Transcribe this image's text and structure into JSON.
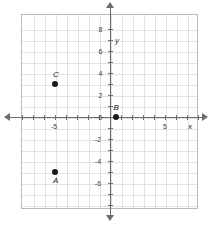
{
  "figure": {
    "axis_labels": {
      "x": "x",
      "y": "y"
    },
    "colors": {
      "grid": "#e2e2e6",
      "axis": "#6b6b70",
      "point": "#1a1a1a",
      "frame": "#b9b9bd",
      "background": "#ffffff"
    }
  },
  "chart_data": {
    "type": "scatter",
    "title": "",
    "xlabel": "x",
    "ylabel": "y",
    "xlim": [
      -8,
      8
    ],
    "ylim": [
      -8,
      8
    ],
    "grid": true,
    "grid_step": 1,
    "legend": "none",
    "xticks": [
      -8,
      -7,
      -6,
      -5,
      -4,
      -3,
      -2,
      -1,
      0,
      1,
      2,
      3,
      4,
      5,
      6,
      7,
      8
    ],
    "yticks": [
      -8,
      -7,
      -6,
      -5,
      -4,
      -3,
      -2,
      -1,
      0,
      1,
      2,
      3,
      4,
      5,
      6,
      7,
      8
    ],
    "xtick_labels": [
      {
        "value": -5,
        "text": "-5"
      },
      {
        "value": 5,
        "text": "5"
      }
    ],
    "ytick_labels": [
      {
        "value": 8,
        "text": "8"
      },
      {
        "value": 6,
        "text": "6"
      },
      {
        "value": 4,
        "text": "4"
      },
      {
        "value": 2,
        "text": "2"
      },
      {
        "value": 0,
        "text": "0"
      },
      {
        "value": -2,
        "text": "-2"
      },
      {
        "value": -4,
        "text": "-4"
      },
      {
        "value": -6,
        "text": "-6"
      }
    ],
    "points": [
      {
        "label": "A",
        "x": -5,
        "y": -5,
        "label_position": "below"
      },
      {
        "label": "B",
        "x": 0.5,
        "y": 0,
        "label_position": "above"
      },
      {
        "label": "C",
        "x": -5,
        "y": 3,
        "label_position": "above"
      }
    ]
  }
}
